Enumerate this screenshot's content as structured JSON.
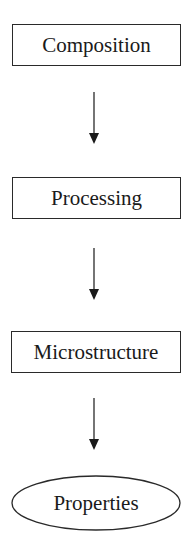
{
  "diagram": {
    "type": "flowchart",
    "direction": "top-to-bottom",
    "nodes": [
      {
        "id": "composition",
        "label": "Composition",
        "shape": "rectangle"
      },
      {
        "id": "processing",
        "label": "Processing",
        "shape": "rectangle"
      },
      {
        "id": "microstructure",
        "label": "Microstructure",
        "shape": "rectangle"
      },
      {
        "id": "properties",
        "label": "Properties",
        "shape": "ellipse"
      }
    ],
    "edges": [
      {
        "from": "composition",
        "to": "processing"
      },
      {
        "from": "processing",
        "to": "microstructure"
      },
      {
        "from": "microstructure",
        "to": "properties"
      }
    ],
    "colors": {
      "stroke": "#2a2a2a",
      "text": "#1a1a1a",
      "background": "#ffffff"
    }
  }
}
